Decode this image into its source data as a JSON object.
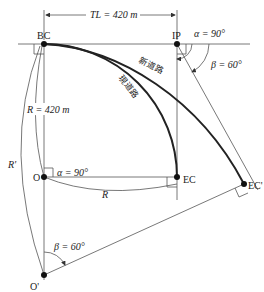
{
  "diagram": {
    "points": {
      "bc": "BC",
      "ip": "IP",
      "ec": "EC",
      "ec_prime": "EC'",
      "o": "O",
      "o_prime": "O'"
    },
    "dimensions": {
      "tl": "TL = 420 m",
      "r": "R = 420 m",
      "r_label": "R",
      "r_prime": "R'"
    },
    "angles": {
      "alpha_ip": "α = 90°",
      "beta_ip": "β = 60°",
      "alpha_o": "α = 90°",
      "beta_o": "β = 60°"
    },
    "roads": {
      "new_road": "新道路",
      "current_road": "現道路"
    }
  }
}
